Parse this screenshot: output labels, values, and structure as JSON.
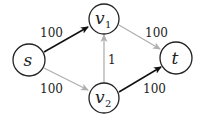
{
  "diagram": {
    "type": "flow-network",
    "nodes": [
      {
        "id": "s",
        "label": "s",
        "sub": "",
        "cx": 29,
        "cy": 60,
        "r": 16
      },
      {
        "id": "v1",
        "label": "v",
        "sub": "1",
        "cx": 104,
        "cy": 19,
        "r": 15
      },
      {
        "id": "v2",
        "label": "v",
        "sub": "2",
        "cx": 104,
        "cy": 98,
        "r": 15
      },
      {
        "id": "t",
        "label": "t",
        "sub": "",
        "cx": 176,
        "cy": 58,
        "r": 16
      }
    ],
    "edges": [
      {
        "from": "s",
        "to": "v1",
        "capacity": "100",
        "color": "#111111"
      },
      {
        "from": "s",
        "to": "v2",
        "capacity": "100",
        "color": "#b0b0b0"
      },
      {
        "from": "v2",
        "to": "v1",
        "capacity": "1",
        "color": "#b0b0b0"
      },
      {
        "from": "v1",
        "to": "t",
        "capacity": "100",
        "color": "#b0b0b0"
      },
      {
        "from": "v2",
        "to": "t",
        "capacity": "100",
        "color": "#111111"
      }
    ],
    "colors": {
      "highlighted_edge": "#111111",
      "normal_edge": "#b0b0b0",
      "node_stroke": "#222222"
    }
  }
}
